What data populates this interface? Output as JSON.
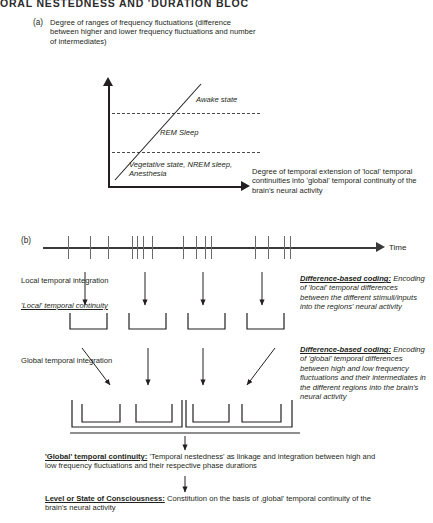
{
  "running_head": "ORAL NESTEDNESS AND 'DURATION BLOC",
  "panel_a": {
    "letter": "(a)",
    "caption": "Degree of ranges of frequency fluctuations (difference between higher and lower frequency fluctuations and number of intermediates)",
    "xaxis_caption": "Degree of temporal extension of 'local' temporal continuities into 'global' temporal continuity of the brain's neural activity",
    "state_labels": [
      "Awake state",
      "REM Sleep",
      "Vegetative state, NREM sleep, Anesthesia"
    ]
  },
  "panel_b": {
    "letter": "(b)",
    "time_label": "Time",
    "tick_positions": [
      68,
      90,
      108,
      132,
      137,
      143,
      152,
      183,
      196,
      205,
      211,
      255,
      268,
      284,
      290
    ],
    "local_integration_label": "Local temporal integration",
    "local_continuity_label": "'Local' temporal continuity",
    "global_integration_label": "Global temporal integration",
    "note_local": {
      "head": "Difference-based coding:",
      "body": " Encoding of 'local' temporal differences between the different stimuli/inputs into the regions' neural activity"
    },
    "note_global": {
      "head": "Difference-based coding:",
      "body": " Encoding of 'global' temporal differences between high and low frequency fluctuations and their intermediates in the different regions into the brain's neural activity"
    }
  },
  "statements": {
    "global_continuity": {
      "head": "'Global' temporal continuity:",
      "body": " 'Temporal nestedness' as linkage and integration between high and low frequency fluctuations and their respective phase durations"
    },
    "level_of_consciousness": {
      "head": "Level or State of Consciousness:",
      "body": " Constitution on the basis of ‚global' temporal continuity of the brain's neural activity"
    }
  },
  "colors": {
    "ink": "#231f20",
    "axis": "#3a3a3a",
    "tick": "#6a6a6a",
    "background": "#ffffff"
  }
}
